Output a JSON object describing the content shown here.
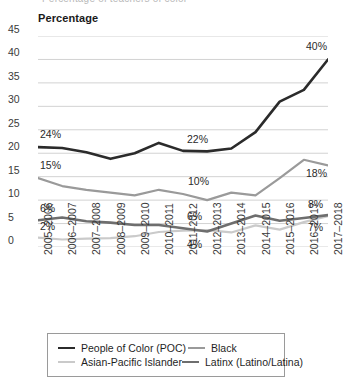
{
  "top_cut_text": "Percentage of teachers of color",
  "axis_title": "Percentage",
  "legend": {
    "rows": [
      [
        {
          "label": "People of Color (POC)",
          "color": "#2b2b2b",
          "width": 2.6
        },
        {
          "label": "Black",
          "color": "#9a9a9a",
          "width": 2.2
        }
      ],
      [
        {
          "label": "Asian-Pacific Islander",
          "color": "#cacaca",
          "width": 2.2
        },
        {
          "label": "Latinx (Latino/Latina)",
          "color": "#6e6e6e",
          "width": 2.6
        }
      ]
    ]
  },
  "chart_data": {
    "type": "line",
    "title": "Percentage",
    "xlabel": "",
    "ylabel": "Percentage",
    "ylim": [
      0,
      45
    ],
    "yticks": [
      0,
      5,
      10,
      15,
      20,
      25,
      30,
      35,
      40,
      45
    ],
    "ytick_labels": [
      "0",
      "5",
      "10",
      "15",
      "20",
      "25",
      "30",
      "35",
      "40",
      "45"
    ],
    "grid": true,
    "legend_position": "bottom",
    "categories": [
      "2005–2006",
      "2006–2007",
      "2007–2008",
      "2008–2009",
      "2009–2010",
      "2010–2011",
      "2011–2012",
      "2012–2013",
      "2013–2014",
      "2014–2015",
      "2015–2016",
      "2016–2017",
      "2017–2018"
    ],
    "series": [
      {
        "name": "People of Color (POC)",
        "color": "#2b2b2b",
        "width": 2.6,
        "values": [
          21.3,
          21.1,
          20.2,
          18.8,
          20.0,
          22.2,
          20.5,
          20.4,
          21.0,
          24.5,
          31.0,
          33.5,
          40.0
        ],
        "labels": [
          {
            "index": 0,
            "text": "24%",
            "dx": 2,
            "dy": -13
          },
          {
            "index": 6,
            "text": "22%",
            "dx": 4,
            "dy": -12
          },
          {
            "index": 12,
            "text": "40%",
            "dx": -22,
            "dy": -13
          }
        ]
      },
      {
        "name": "Black",
        "color": "#9a9a9a",
        "width": 2.2,
        "values": [
          14.7,
          13.0,
          12.2,
          11.6,
          11.0,
          12.2,
          11.3,
          10.0,
          11.6,
          11.0,
          14.7,
          18.6,
          17.4
        ],
        "labels": [
          {
            "index": 0,
            "text": "15%",
            "dx": 2,
            "dy": -13
          },
          {
            "index": 6,
            "text": "10%",
            "dx": 5,
            "dy": -13
          },
          {
            "index": 12,
            "text": "18%",
            "dx": -22,
            "dy": 8
          }
        ]
      },
      {
        "name": "Asian-Pacific Islander",
        "color": "#cacaca",
        "width": 2.2,
        "values": [
          2.0,
          1.6,
          1.8,
          1.9,
          2.3,
          3.2,
          3.5,
          3.6,
          3.1,
          4.6,
          3.7,
          5.3,
          6.6
        ],
        "labels": [
          {
            "index": 0,
            "text": "2%",
            "dx": 2,
            "dy": -12
          },
          {
            "index": 6,
            "text": "4%",
            "dx": 4,
            "dy": 13
          },
          {
            "index": 12,
            "text": "7%",
            "dx": -20,
            "dy": 11
          }
        ]
      },
      {
        "name": "Latinx (Latino/Latina)",
        "color": "#6e6e6e",
        "width": 2.6,
        "values": [
          5.7,
          6.3,
          5.5,
          5.2,
          4.7,
          4.7,
          4.0,
          3.3,
          5.0,
          6.7,
          5.6,
          6.2,
          6.8
        ],
        "labels": [
          {
            "index": 0,
            "text": "6%",
            "dx": 2,
            "dy": -12
          },
          {
            "index": 6,
            "text": "6%",
            "dx": 4,
            "dy": -12
          },
          {
            "index": 12,
            "text": "8%",
            "dx": -20,
            "dy": -11
          }
        ]
      }
    ]
  }
}
